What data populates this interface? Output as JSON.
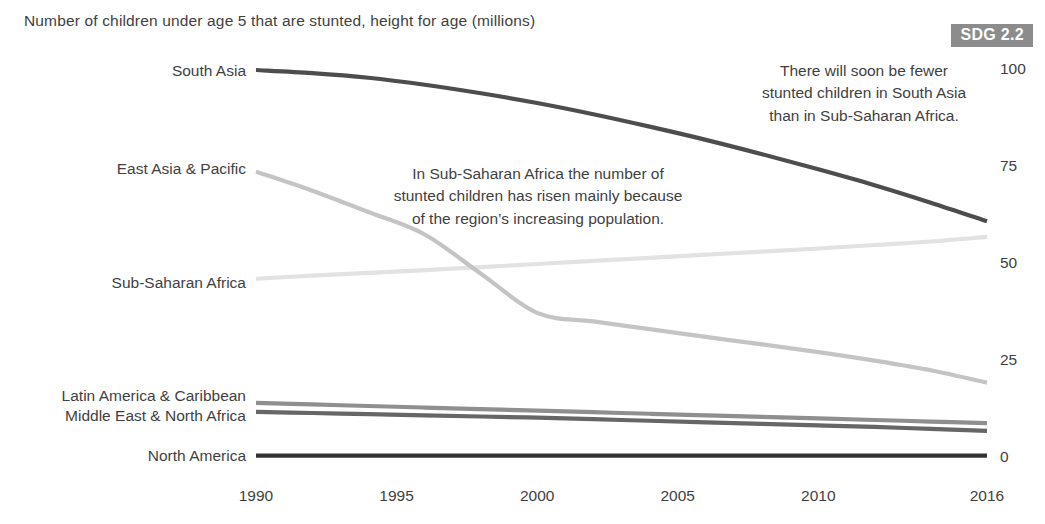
{
  "chart_data": {
    "type": "line",
    "title": "Number of children under age 5 that are stunted, height for age (millions)",
    "xlabel": "",
    "ylabel": "",
    "xlim": [
      1990,
      2016
    ],
    "ylim": [
      0,
      100
    ],
    "grid": false,
    "legend_position": "left-inline-labels",
    "y_ticks": [
      "100",
      "75",
      "50",
      "25",
      "0"
    ],
    "y_tick_values": [
      100,
      75,
      50,
      25,
      0
    ],
    "x_ticks": [
      "1990",
      "1995",
      "2000",
      "2005",
      "2010",
      "2016"
    ],
    "x_tick_values": [
      1990,
      1995,
      2000,
      2005,
      2010,
      2016
    ],
    "x": [
      1990,
      1992,
      1994,
      1996,
      1998,
      2000,
      2002,
      2004,
      2006,
      2008,
      2010,
      2012,
      2014,
      2016
    ],
    "series": [
      {
        "name": "South Asia",
        "color": "#4d4d4d",
        "width": 4.2,
        "values": [
          100.0,
          99.2,
          98.0,
          96.2,
          94.0,
          91.5,
          88.6,
          85.4,
          82.0,
          78.3,
          74.4,
          70.3,
          65.8,
          61.0
        ]
      },
      {
        "name": "East Asia & Pacific",
        "color": "#c4c4c4",
        "width": 4.2,
        "values": [
          73.8,
          68.9,
          63.4,
          57.6,
          47.5,
          37.4,
          35.2,
          33.2,
          31.2,
          29.3,
          27.3,
          25.1,
          22.6,
          19.4
        ]
      },
      {
        "name": "Sub-Saharan Africa",
        "color": "#e2e2e2",
        "width": 4.2,
        "values": [
          46.2,
          47.0,
          47.7,
          48.4,
          49.2,
          50.0,
          50.8,
          51.6,
          52.4,
          53.2,
          54.0,
          54.9,
          55.8,
          57.0
        ]
      },
      {
        "name": "Latin America & Caribbean",
        "color": "#8f8f8f",
        "width": 4.2,
        "values": [
          14.2,
          13.8,
          13.4,
          13.0,
          12.6,
          12.2,
          11.8,
          11.4,
          11.0,
          10.6,
          10.2,
          9.8,
          9.4,
          9.0
        ]
      },
      {
        "name": "Middle East & North Africa",
        "color": "#666666",
        "width": 4.2,
        "values": [
          11.9,
          11.6,
          11.3,
          11.0,
          10.7,
          10.4,
          10.0,
          9.6,
          9.2,
          8.8,
          8.4,
          8.0,
          7.5,
          7.0
        ]
      },
      {
        "name": "North America",
        "color": "#333333",
        "width": 4.2,
        "values": [
          0.6,
          0.6,
          0.6,
          0.6,
          0.6,
          0.6,
          0.6,
          0.6,
          0.6,
          0.6,
          0.6,
          0.6,
          0.6,
          0.6
        ]
      }
    ],
    "annotations": [
      {
        "id": "annotation-right",
        "lines": [
          "There will soon be fewer",
          "stunted children in South Asia",
          "than in Sub-Saharan Africa."
        ]
      },
      {
        "id": "annotation-left",
        "lines": [
          "In Sub-Saharan Africa the number of",
          "stunted children has risen mainly because",
          "of the region’s increasing population."
        ]
      }
    ],
    "series_label_positions": [
      {
        "name": "South Asia",
        "y": 61
      },
      {
        "name": "East Asia & Pacific",
        "y": 159
      },
      {
        "name": "Sub-Saharan Africa",
        "y": 273
      },
      {
        "name": "Latin America & Caribbean",
        "y": 386
      },
      {
        "name": "Middle East & North Africa",
        "y": 406
      },
      {
        "name": "North America",
        "y": 446
      }
    ]
  },
  "badge": {
    "label": "SDG 2.2",
    "background": "#8c8c8c",
    "text_color": "#ffffff"
  }
}
